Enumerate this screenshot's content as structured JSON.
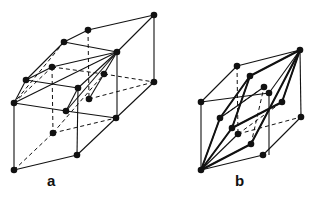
{
  "figure": {
    "panels": [
      {
        "id": "a",
        "label": "a",
        "label_pos": [
          47,
          172
        ],
        "nodes": [
          [
            154,
            15
          ],
          [
            88,
            30
          ],
          [
            64,
            42
          ],
          [
            117,
            52
          ],
          [
            52,
            67
          ],
          [
            104,
            74
          ],
          [
            26,
            80
          ],
          [
            154,
            82
          ],
          [
            78,
            88
          ],
          [
            89,
            99
          ],
          [
            14,
            103
          ],
          [
            66,
            111
          ],
          [
            116,
            118
          ],
          [
            53,
            133
          ],
          [
            77,
            155
          ],
          [
            14,
            170
          ]
        ],
        "solid_edges": [
          [
            88,
            30,
            154,
            15
          ],
          [
            154,
            15,
            154,
            82
          ],
          [
            154,
            15,
            117,
            52
          ],
          [
            88,
            30,
            64,
            42
          ],
          [
            64,
            42,
            117,
            52
          ],
          [
            64,
            42,
            26,
            80
          ],
          [
            26,
            80,
            14,
            103
          ],
          [
            26,
            80,
            78,
            88
          ],
          [
            78,
            88,
            117,
            52
          ],
          [
            14,
            103,
            66,
            111
          ],
          [
            66,
            111,
            78,
            88
          ],
          [
            14,
            103,
            117,
            52
          ],
          [
            52,
            67,
            117,
            52
          ],
          [
            26,
            80,
            52,
            67
          ],
          [
            117,
            52,
            117,
            118
          ],
          [
            154,
            82,
            116,
            118
          ],
          [
            66,
            111,
            116,
            118
          ],
          [
            14,
            103,
            14,
            170
          ],
          [
            14,
            170,
            77,
            155
          ],
          [
            77,
            155,
            116,
            118
          ],
          [
            78,
            88,
            77,
            155
          ],
          [
            117,
            52,
            66,
            111
          ],
          [
            117,
            52,
            89,
            99
          ]
        ],
        "dashed_edges": [
          [
            88,
            30,
            89,
            99
          ],
          [
            52,
            67,
            53,
            133
          ],
          [
            52,
            67,
            104,
            74
          ],
          [
            104,
            74,
            154,
            82
          ],
          [
            89,
            99,
            154,
            82
          ],
          [
            53,
            133,
            116,
            118
          ],
          [
            14,
            170,
            53,
            133
          ],
          [
            53,
            133,
            104,
            74
          ],
          [
            14,
            103,
            52,
            67
          ],
          [
            64,
            42,
            14,
            103
          ]
        ]
      },
      {
        "id": "b",
        "label": "b",
        "label_pos": [
          235,
          172
        ],
        "nodes": [
          [
            300,
            50
          ],
          [
            237,
            66
          ],
          [
            250,
            76
          ],
          [
            269,
            93
          ],
          [
            264,
            87
          ],
          [
            201,
            102
          ],
          [
            282,
            102
          ],
          [
            220,
            118
          ],
          [
            301,
            117
          ],
          [
            232,
            128
          ],
          [
            238,
            134
          ],
          [
            251,
            144
          ],
          [
            263,
            155
          ],
          [
            201,
            170
          ]
        ],
        "solid_edges": [
          [
            237,
            66,
            300,
            50
          ],
          [
            300,
            50,
            301,
            117
          ],
          [
            201,
            102,
            237,
            66
          ],
          [
            201,
            102,
            269,
            93
          ],
          [
            269,
            93,
            300,
            50
          ],
          [
            201,
            102,
            201,
            170
          ],
          [
            201,
            170,
            263,
            155
          ],
          [
            263,
            155,
            301,
            117
          ],
          [
            269,
            93,
            269,
            155
          ],
          [
            201,
            170,
            220,
            118
          ],
          [
            220,
            118,
            250,
            76
          ],
          [
            250,
            76,
            300,
            50
          ],
          [
            201,
            170,
            232,
            128
          ],
          [
            232,
            128,
            282,
            102
          ],
          [
            282,
            102,
            300,
            50
          ],
          [
            201,
            170,
            251,
            144
          ],
          [
            251,
            144,
            300,
            50
          ],
          [
            201,
            170,
            238,
            134
          ],
          [
            250,
            76,
            232,
            128
          ],
          [
            220,
            118,
            264,
            87
          ]
        ],
        "dashed_edges": [
          [
            237,
            66,
            238,
            134
          ],
          [
            238,
            134,
            301,
            117
          ],
          [
            220,
            118,
            264,
            87
          ],
          [
            238,
            134,
            282,
            102
          ],
          [
            251,
            144,
            264,
            87
          ]
        ],
        "heavy_edges": [
          [
            201,
            170,
            220,
            118
          ],
          [
            220,
            118,
            250,
            76
          ],
          [
            250,
            76,
            300,
            50
          ],
          [
            201,
            170,
            232,
            128
          ],
          [
            232,
            128,
            282,
            102
          ],
          [
            282,
            102,
            300,
            50
          ],
          [
            201,
            170,
            251,
            144
          ],
          [
            251,
            144,
            300,
            50
          ],
          [
            250,
            76,
            232,
            128
          ]
        ]
      }
    ]
  }
}
